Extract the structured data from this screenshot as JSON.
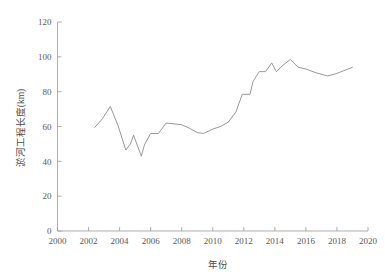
{
  "chart_data": {
    "type": "line",
    "title": "",
    "subtitle": "",
    "xlabel": "年份",
    "ylabel": "淤河工程长度(km)",
    "xlim": [
      2000,
      2020
    ],
    "ylim": [
      0,
      120
    ],
    "xticks": [
      "2000",
      "2002",
      "2004",
      "2006",
      "2008",
      "2010",
      "2012",
      "2014",
      "2016",
      "2018",
      "2020"
    ],
    "xtick_values": [
      2000,
      2002,
      2004,
      2006,
      2008,
      2010,
      2012,
      2014,
      2016,
      2018,
      2020
    ],
    "yticks": [
      "0",
      "20",
      "40",
      "60",
      "80",
      "100",
      "120"
    ],
    "ytick_values": [
      0,
      20,
      40,
      60,
      80,
      100,
      120
    ],
    "grid": false,
    "legend": null,
    "legend_position": "none",
    "line_color": "#8c8c8c",
    "axis_color": "#9a9a9a",
    "text_color": "#4a4a4a",
    "background": "#ffffff",
    "series": [
      {
        "name": "淤河工程长度",
        "x": [
          2002.4,
          2002.9,
          2003.4,
          2003.9,
          2004.4,
          2004.7,
          2004.9,
          2005.4,
          2005.6,
          2006.0,
          2006.5,
          2007.0,
          2007.5,
          2008.0,
          2008.5,
          2009.0,
          2009.4,
          2010.0,
          2010.5,
          2011.0,
          2011.5,
          2011.9,
          2012.4,
          2012.6,
          2013.0,
          2013.4,
          2013.8,
          2014.1,
          2014.5,
          2015.0,
          2015.5,
          2016.0,
          2016.6,
          2017.4,
          2018.0,
          2019.0
        ],
        "values": [
          59.5,
          64.5,
          71.5,
          60.5,
          46.5,
          50.0,
          55.0,
          43.0,
          49.5,
          56.0,
          56.0,
          62.0,
          61.5,
          61.0,
          59.0,
          56.5,
          56.0,
          58.5,
          60.0,
          62.5,
          68.5,
          78.5,
          78.5,
          86.0,
          91.5,
          91.5,
          96.5,
          91.5,
          95.0,
          98.5,
          94.0,
          93.0,
          91.0,
          89.0,
          90.5,
          94.0
        ]
      }
    ]
  },
  "axes": {
    "x_title": "年份",
    "y_title": "淤河工程长度(km)"
  }
}
